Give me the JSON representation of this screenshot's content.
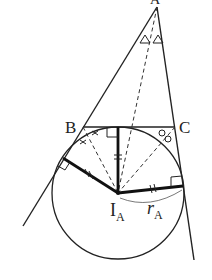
{
  "figure": {
    "type": "geometry-excircle",
    "colors": {
      "stroke": "#222222",
      "background": "#ffffff"
    },
    "points": {
      "A": {
        "label": "A",
        "x": 157,
        "y": 7
      },
      "B": {
        "label": "B",
        "x": 83,
        "y": 127
      },
      "C": {
        "label": "C",
        "x": 175,
        "y": 127
      },
      "IA": {
        "label": "I",
        "subscript": "A",
        "x": 118,
        "y": 193
      }
    },
    "radius_label": {
      "main": "r",
      "subscript": "A"
    },
    "circle": {
      "cx": 118,
      "cy": 193,
      "r": 66
    },
    "tangent_points": [
      {
        "name": "top",
        "x": 118,
        "y": 127
      },
      {
        "name": "left",
        "x": 63,
        "y": 158
      },
      {
        "name": "right",
        "x": 183,
        "y": 186
      }
    ],
    "markings": {
      "angle_A": "△△",
      "angle_B": "××",
      "angle_C": "○○",
      "equal_radii": "//"
    }
  }
}
